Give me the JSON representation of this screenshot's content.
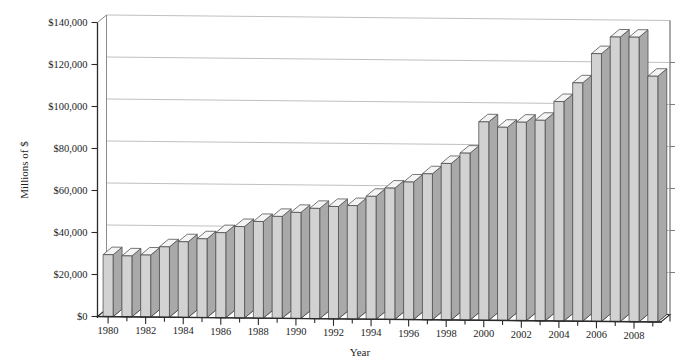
{
  "chart_data": {
    "type": "bar",
    "title": "",
    "subtitle": "",
    "xlabel": "Year",
    "ylabel": "Millions of $",
    "ylim": [
      0,
      140000
    ],
    "ytick_labels": [
      "$0",
      "$20,000",
      "$40,000",
      "$60,000",
      "$80,000",
      "$100,000",
      "$120,000",
      "$140,000"
    ],
    "ytick_values": [
      0,
      20000,
      40000,
      60000,
      80000,
      100000,
      120000,
      140000
    ],
    "grid": true,
    "legend": "none",
    "three_d": true,
    "xtick_labels_shown": [
      "1980",
      "1982",
      "1984",
      "1986",
      "1988",
      "1990",
      "1992",
      "1994",
      "1996",
      "1998",
      "2000",
      "2002",
      "2004",
      "2006",
      "2008"
    ],
    "categories": [
      "1980",
      "1981",
      "1982",
      "1983",
      "1984",
      "1985",
      "1986",
      "1987",
      "1988",
      "1989",
      "1990",
      "1991",
      "1992",
      "1993",
      "1994",
      "1995",
      "1996",
      "1997",
      "1998",
      "1999",
      "2000",
      "2001",
      "2002",
      "2003",
      "2004",
      "2005",
      "2006",
      "2007",
      "2008",
      "2009"
    ],
    "values": [
      29500,
      29000,
      29500,
      33500,
      36000,
      37500,
      40500,
      43500,
      46000,
      48500,
      50500,
      52500,
      53500,
      54000,
      58500,
      62500,
      65500,
      69500,
      74500,
      79500,
      94500,
      92000,
      94500,
      95500,
      104500,
      113500,
      127500,
      135500,
      135500,
      117000
    ]
  },
  "colors": {
    "bar_front": "#d2d2d2",
    "bar_top": "#f4f4f4",
    "bar_side": "#a9a9a9",
    "gridline": "#b9b9b9",
    "axis": "#2a2a2a",
    "background": "#ffffff"
  }
}
